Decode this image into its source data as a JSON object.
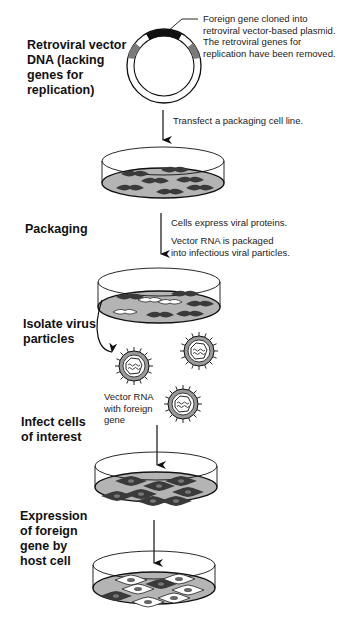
{
  "diagram": {
    "steps": [
      {
        "label": "Retroviral vector\nDNA (lacking\ngenes for\nreplication)"
      },
      {
        "label": "Packaging"
      },
      {
        "label": "Isolate virus\nparticles"
      },
      {
        "label": "Infect cells\nof interest"
      },
      {
        "label": "Expression\nof foreign\ngene by\nhost cell"
      }
    ],
    "annotations": {
      "plasmid_note": "Foreign gene cloned into\nretroviral vector-based plasmid.\nThe retroviral genes for\nreplication have been removed.",
      "transfect": "Transfect a packaging cell line.",
      "express": "Cells express viral proteins.",
      "packaged": "Vector RNA is packaged\ninto infectious viral particles.",
      "vector_rna": "Vector RNA\nwith foreign\ngene"
    },
    "colors": {
      "ink": "#111111",
      "dish_fill": "#b4b4b4",
      "cell_fill": "#3a3a3a",
      "segment_gray": "#7a7a7a"
    }
  }
}
